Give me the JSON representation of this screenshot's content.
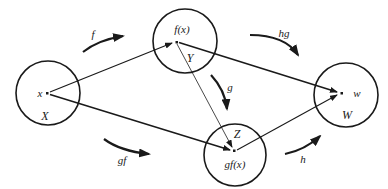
{
  "diagram": {
    "type": "function-composition",
    "colors": {
      "stroke": "#1a1a1a",
      "background": "#ffffff"
    },
    "sets": [
      {
        "id": "X",
        "label": "X",
        "element": "x",
        "cx": 48,
        "cy": 93,
        "r": 32,
        "px": 47,
        "py": 93
      },
      {
        "id": "Y",
        "label": "Y",
        "element": "f(x)",
        "cx": 185,
        "cy": 41,
        "r": 32,
        "px": 176,
        "py": 42
      },
      {
        "id": "Z",
        "label": "Z",
        "element": "gf(x)",
        "cx": 235,
        "cy": 155,
        "r": 31,
        "px": 234,
        "py": 150
      },
      {
        "id": "W",
        "label": "W",
        "element": "w",
        "cx": 346,
        "cy": 95,
        "r": 32,
        "px": 341,
        "py": 93
      }
    ],
    "maps": [
      {
        "id": "f",
        "label": "f",
        "from": "x",
        "to": "f(x)"
      },
      {
        "id": "g",
        "label": "g",
        "from": "f(x)",
        "to": "gf(x)"
      },
      {
        "id": "h",
        "label": "h",
        "from": "gf(x)",
        "to": "w"
      },
      {
        "id": "gf",
        "label": "gf",
        "from": "x",
        "to": "gf(x)"
      },
      {
        "id": "hg",
        "label": "hg",
        "from": "f(x)",
        "to": "w"
      }
    ]
  }
}
